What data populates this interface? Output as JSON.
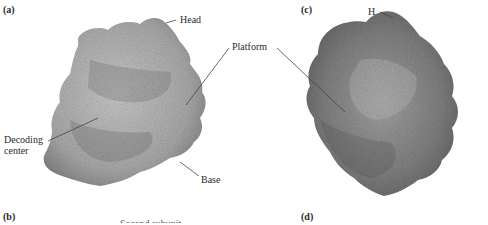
{
  "figure": {
    "panels": [
      {
        "id": "a",
        "label": "(a)"
      },
      {
        "id": "b",
        "label": "(b)"
      },
      {
        "id": "c",
        "label": "(c)"
      },
      {
        "id": "d",
        "label": "(d)"
      }
    ],
    "callouts": {
      "head": "Head",
      "platform": "Platform",
      "decoding_center_line1": "Decoding",
      "decoding_center_line2": "center",
      "base": "Base",
      "h": "H"
    },
    "partial_caption": "Second subunit",
    "colors": {
      "structure_light": "#b8b8b8",
      "structure_mid": "#8f8f8f",
      "structure_dark": "#5e5e5e",
      "leader_line": "#444444",
      "text": "#2a2a2a"
    }
  }
}
